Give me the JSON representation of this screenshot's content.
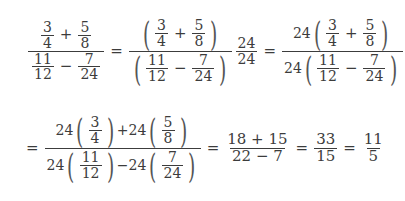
{
  "equation": {
    "line1": {
      "lhs": {
        "a_num": "3",
        "a_den": "4",
        "plus": "+",
        "b_num": "5",
        "b_den": "8",
        "c_num": "11",
        "c_den": "12",
        "minus": "−",
        "d_num": "7",
        "d_den": "24"
      },
      "eq1": "=",
      "step1": {
        "a_num": "3",
        "a_den": "4",
        "plus": "+",
        "b_num": "5",
        "b_den": "8",
        "c_num": "11",
        "c_den": "12",
        "minus": "−",
        "d_num": "7",
        "d_den": "24",
        "mul_num": "24",
        "mul_den": "24"
      },
      "eq2": "=",
      "step2": {
        "coef_num": "24",
        "a_num": "3",
        "a_den": "4",
        "plus": "+",
        "b_num": "5",
        "b_den": "8",
        "coef_den": "24",
        "c_num": "11",
        "c_den": "12",
        "minus": "−",
        "d_num": "7",
        "d_den": "24"
      }
    },
    "line2": {
      "eq0": "=",
      "step3": {
        "coef": "24",
        "a_num": "3",
        "a_den": "4",
        "plus": "+",
        "b_num": "5",
        "b_den": "8",
        "c_num": "11",
        "c_den": "12",
        "minus": "−",
        "d_num": "7",
        "d_den": "24"
      },
      "eq1": "=",
      "step4": {
        "num": "18 + 15",
        "den": "22 − 7"
      },
      "eq2": "=",
      "step5": {
        "num": "33",
        "den": "15"
      },
      "eq3": "=",
      "result": {
        "num": "11",
        "den": "5"
      }
    }
  }
}
